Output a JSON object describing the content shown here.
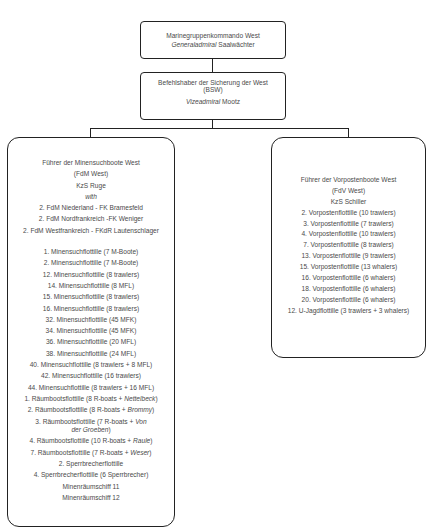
{
  "top_box": {
    "title": "Marinegruppenkommando West",
    "rank": "Generaladmiral",
    "name": "Saalwächter"
  },
  "middle_box": {
    "title_line1": "Befehlshaber der Sicherung der West",
    "title_line2": "(BSW)",
    "rank": "Vizeadmiral",
    "name": "Mootz"
  },
  "left_box": {
    "title": "Führer der Minensuchboote West",
    "abbr": "(FdM West)",
    "commander": "KzS Ruge",
    "with_label": "with",
    "subcommands": [
      "2. FdM Niederland - FK Bramesfeld",
      "2. FdM Nordfrankreich  -FK Weniger",
      "2. FdM Westfrankreich - FKdR Lautenschlager"
    ],
    "units": [
      {
        "text": "1. Minensuchflottille (7 M-Boote)"
      },
      {
        "text": "2. Minensuchflottille (7 M-Boote)"
      },
      {
        "text": "12. Minensuchflottille (8 trawlers)"
      },
      {
        "text": "14. Minensuchflottille (8 MFL)"
      },
      {
        "text": "15. Minensuchflottille (8 trawlers)"
      },
      {
        "text": "16. Minensuchflottille (8 trawlers)"
      },
      {
        "text": "32. Minensuchflottille (45 MFK)"
      },
      {
        "text": "34. Minensuchflottille (45 MFK)"
      },
      {
        "text": "36. Minensuchflottille (20 MFL)"
      },
      {
        "text": "38. Minensuchflottille (24 MFL)"
      },
      {
        "text": "40. Minensuchflottille (8 trawlers + 8 MFL)"
      },
      {
        "text": "42. Minensuchflottille (16 trawlers)"
      },
      {
        "text": "44. Minensuchflottille (8 trawlers + 16 MFL)"
      },
      {
        "prefix": "1. Räumbootsflottille (8 R-boats + ",
        "italic": "Nettelbeck",
        "suffix": ")"
      },
      {
        "prefix": "2. Räumbootsflottille (8 R-boats + ",
        "italic": "Brommy",
        "suffix": ")"
      },
      {
        "prefix": "3. Räumbootsflottille (7 R-boats + ",
        "italic": "Von der Groeben",
        "suffix": ")"
      },
      {
        "prefix": "4. Räumbootsflottille (10 R-boats + ",
        "italic": "Raule",
        "suffix": ")"
      },
      {
        "prefix": "7. Räumbootsflottille (7 R-boats + ",
        "italic": "Weser",
        "suffix": ")"
      },
      {
        "text": "2. Sperrbrecherflottille"
      },
      {
        "text": "4. Sperrbrecherflottille (6 Sperrbrecher)"
      },
      {
        "text": "Minenräumschiff 11"
      },
      {
        "text": "Minenräumschiff 12"
      }
    ]
  },
  "right_box": {
    "title": "Führer der Vorpostenboote West",
    "abbr": "(FdV West)",
    "commander": "KzS Schiller",
    "units": [
      "2. Vorpostenflottille (10 trawlers)",
      "3. Vorpostenflottille (7 trawlers)",
      "4. Vorpostenflottille (10 trawlers)",
      "7. Vorpostenflottille (8 trawlers)",
      "13. Vorpostenflottille (9 trawlers)",
      "15. Vorpostenflottille (13 whalers)",
      "16. Vorpostenflottille (6 whalers)",
      "18. Vorpostenflottille (6 whalers)",
      "20. Vorpostenflottille (6 whalers)",
      "12. U-Jagdflottille (3 trawlers + 3 whalers)"
    ]
  }
}
